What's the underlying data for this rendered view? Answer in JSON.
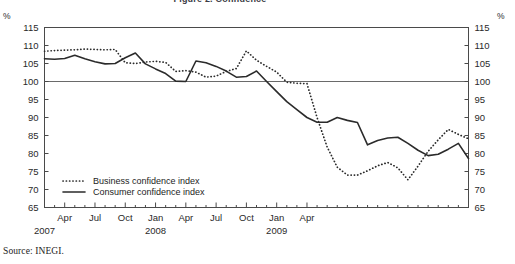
{
  "figure": {
    "title_partial": "Figure 2. Confidence",
    "source_note": "Source:  INEGI.",
    "unit_left": "%",
    "unit_right": "%"
  },
  "chart_data": {
    "type": "line",
    "title": "Figure 2. Confidence",
    "xlabel": "",
    "ylabel": "%",
    "ylim": [
      65,
      115
    ],
    "ytick_values": [
      115,
      110,
      105,
      100,
      95,
      90,
      85,
      80,
      75,
      70,
      65
    ],
    "ytick_labels": [
      "115",
      "110",
      "105",
      "100",
      "95",
      "90",
      "85",
      "80",
      "75",
      "70",
      "65"
    ],
    "grid": false,
    "reference_line": 100,
    "legend_position": "inner-bottom-left",
    "x": [
      "2007-02",
      "2007-03",
      "2007-04",
      "2007-05",
      "2007-06",
      "2007-07",
      "2007-08",
      "2007-09",
      "2007-10",
      "2007-11",
      "2007-12",
      "2008-01",
      "2008-02",
      "2008-03",
      "2008-04",
      "2008-05",
      "2008-06",
      "2008-07",
      "2008-08",
      "2008-09",
      "2008-10",
      "2008-11",
      "2008-12",
      "2009-01",
      "2009-02",
      "2009-03",
      "2009-04",
      "2009-05",
      "2009-06"
    ],
    "xtick_labels": [
      "Apr",
      "Jul",
      "Oct",
      "Jan",
      "Apr",
      "Jul",
      "Oct",
      "Jan",
      "Apr"
    ],
    "xtick_positions": [
      "2007-04",
      "2007-07",
      "2007-10",
      "2008-01",
      "2008-04",
      "2008-07",
      "2008-10",
      "2009-01",
      "2009-04"
    ],
    "year_labels": [
      {
        "label": "2007",
        "at": "2007-02"
      },
      {
        "label": "2008",
        "at": "2008-01"
      },
      {
        "label": "2009",
        "at": "2009-01"
      }
    ],
    "series": [
      {
        "name": "Business confidence index",
        "style": "dotted",
        "color": "#2b2b2b",
        "values": [
          108.4,
          108.6,
          108.7,
          108.8,
          109.0,
          108.9,
          108.8,
          108.9,
          105.2,
          105.0,
          105.4,
          105.6,
          105.3,
          102.8,
          103.0,
          102.6,
          101.2,
          101.5,
          102.8,
          103.6,
          108.5,
          105.9,
          104.2,
          102.6,
          99.8,
          99.5,
          99.4,
          90.0,
          81.8
        ]
      },
      {
        "name": "Consumer confidence index",
        "style": "solid",
        "color": "#2b2b2b",
        "values": [
          106.3,
          106.2,
          106.4,
          107.3,
          106.3,
          105.5,
          104.9,
          105.0,
          106.6,
          107.9,
          104.9,
          103.5,
          102.2,
          100.1,
          100.0,
          105.7,
          105.2,
          104.2,
          102.9,
          101.2,
          101.4,
          102.9,
          100.0,
          97.2,
          94.4,
          92.2,
          90.0,
          88.7,
          88.7
        ]
      }
    ],
    "series_extended": {
      "business": [
        {
          "t": "2007-02",
          "v": 108.4
        },
        {
          "t": "2007-03",
          "v": 108.6
        },
        {
          "t": "2007-04",
          "v": 108.7
        },
        {
          "t": "2007-05",
          "v": 108.8
        },
        {
          "t": "2007-06",
          "v": 109.0
        },
        {
          "t": "2007-07",
          "v": 108.9
        },
        {
          "t": "2007-08",
          "v": 108.8
        },
        {
          "t": "2007-09",
          "v": 108.9
        },
        {
          "t": "2007-10",
          "v": 105.2
        },
        {
          "t": "2007-11",
          "v": 105.0
        },
        {
          "t": "2007-12",
          "v": 105.4
        },
        {
          "t": "2008-01",
          "v": 105.6
        },
        {
          "t": "2008-02",
          "v": 105.3
        },
        {
          "t": "2008-03",
          "v": 102.8
        },
        {
          "t": "2008-04",
          "v": 103.0
        },
        {
          "t": "2008-05",
          "v": 102.6
        },
        {
          "t": "2008-06",
          "v": 101.2
        },
        {
          "t": "2008-07",
          "v": 101.5
        },
        {
          "t": "2008-08",
          "v": 102.8
        },
        {
          "t": "2008-09",
          "v": 103.6
        },
        {
          "t": "2008-10",
          "v": 108.5
        },
        {
          "t": "2008-11",
          "v": 105.9
        },
        {
          "t": "2008-12",
          "v": 104.2
        },
        {
          "t": "2009-01",
          "v": 102.6
        },
        {
          "t": "2009-02",
          "v": 99.8
        },
        {
          "t": "2009-03",
          "v": 99.5
        },
        {
          "t": "2009-04",
          "v": 99.4
        },
        {
          "t": "2009-05",
          "v": 90.0
        },
        {
          "t": "2009-06",
          "v": 81.8
        },
        {
          "t": "2009-07",
          "v": 76.2
        },
        {
          "t": "2009-08",
          "v": 74.0
        },
        {
          "t": "2009-09",
          "v": 74.0
        },
        {
          "t": "2009-10",
          "v": 75.2
        },
        {
          "t": "2009-11",
          "v": 76.6
        },
        {
          "t": "2009-12",
          "v": 77.5
        },
        {
          "t": "2010-01",
          "v": 76.0
        },
        {
          "t": "2010-02",
          "v": 72.7
        },
        {
          "t": "2010-03",
          "v": 76.5
        },
        {
          "t": "2010-04",
          "v": 80.6
        },
        {
          "t": "2010-05",
          "v": 83.8
        },
        {
          "t": "2010-06",
          "v": 86.7
        },
        {
          "t": "2010-07",
          "v": 85.3
        },
        {
          "t": "2010-08",
          "v": 84.1
        }
      ],
      "consumer": [
        {
          "t": "2007-02",
          "v": 106.3
        },
        {
          "t": "2007-03",
          "v": 106.2
        },
        {
          "t": "2007-04",
          "v": 106.4
        },
        {
          "t": "2007-05",
          "v": 107.3
        },
        {
          "t": "2007-06",
          "v": 106.3
        },
        {
          "t": "2007-07",
          "v": 105.5
        },
        {
          "t": "2007-08",
          "v": 104.9
        },
        {
          "t": "2007-09",
          "v": 105.0
        },
        {
          "t": "2007-10",
          "v": 106.6
        },
        {
          "t": "2007-11",
          "v": 107.9
        },
        {
          "t": "2007-12",
          "v": 104.9
        },
        {
          "t": "2008-01",
          "v": 103.5
        },
        {
          "t": "2008-02",
          "v": 102.2
        },
        {
          "t": "2008-03",
          "v": 100.1
        },
        {
          "t": "2008-04",
          "v": 100.0
        },
        {
          "t": "2008-05",
          "v": 105.7
        },
        {
          "t": "2008-06",
          "v": 105.2
        },
        {
          "t": "2008-07",
          "v": 104.2
        },
        {
          "t": "2008-08",
          "v": 102.9
        },
        {
          "t": "2008-09",
          "v": 101.2
        },
        {
          "t": "2008-10",
          "v": 101.4
        },
        {
          "t": "2008-11",
          "v": 102.9
        },
        {
          "t": "2008-12",
          "v": 100.0
        },
        {
          "t": "2009-01",
          "v": 97.2
        },
        {
          "t": "2009-02",
          "v": 94.4
        },
        {
          "t": "2009-03",
          "v": 92.2
        },
        {
          "t": "2009-04",
          "v": 90.0
        },
        {
          "t": "2009-05",
          "v": 88.7
        },
        {
          "t": "2009-06",
          "v": 88.7
        },
        {
          "t": "2009-07",
          "v": 90.0
        },
        {
          "t": "2009-08",
          "v": 89.2
        },
        {
          "t": "2009-09",
          "v": 88.6
        },
        {
          "t": "2009-10",
          "v": 82.4
        },
        {
          "t": "2009-11",
          "v": 83.6
        },
        {
          "t": "2009-12",
          "v": 84.3
        },
        {
          "t": "2010-01",
          "v": 84.5
        },
        {
          "t": "2010-02",
          "v": 82.8
        },
        {
          "t": "2010-03",
          "v": 80.9
        },
        {
          "t": "2010-04",
          "v": 79.4
        },
        {
          "t": "2010-05",
          "v": 79.8
        },
        {
          "t": "2010-06",
          "v": 81.2
        },
        {
          "t": "2010-07",
          "v": 82.8
        },
        {
          "t": "2010-08",
          "v": 78.6
        }
      ]
    },
    "legend": [
      {
        "label": "Business confidence index",
        "style": "dotted"
      },
      {
        "label": "Consumer confidence index",
        "style": "solid"
      }
    ]
  }
}
